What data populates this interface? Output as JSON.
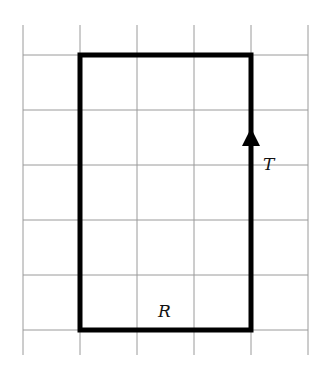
{
  "diagram": {
    "type": "grid-rectangle-path",
    "grid": {
      "columns": 5,
      "rows": 6,
      "x_lines": [
        23,
        80,
        137,
        194,
        251,
        308
      ],
      "y_lines": [
        55,
        110,
        165,
        220,
        275,
        330
      ],
      "extent_top": 25,
      "extent_bottom": 355,
      "line_color": "#9a9a9a"
    },
    "rectangle": {
      "x1": 80,
      "y1": 55,
      "x2": 251,
      "y2": 330,
      "stroke_color": "#000000",
      "stroke_width": 5
    },
    "arrow": {
      "x": 251,
      "y": 140,
      "direction": "up"
    },
    "labels": {
      "right_side": "T",
      "bottom_side": "R"
    }
  }
}
